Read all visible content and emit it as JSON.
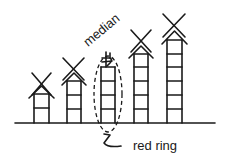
{
  "diagram": {
    "labels": {
      "median": "median",
      "ring": "red ring"
    },
    "towers": [
      {
        "name": "tower-1",
        "stories": 2,
        "has_blades": true
      },
      {
        "name": "tower-2",
        "stories": 3,
        "has_blades": true
      },
      {
        "name": "tower-3",
        "stories": 4,
        "has_blades": false,
        "is_median": true,
        "circled": true
      },
      {
        "name": "tower-4",
        "stories": 5,
        "has_blades": true
      },
      {
        "name": "tower-5",
        "stories": 6,
        "has_blades": true
      }
    ],
    "colors": {
      "ink": "#1a1a1a",
      "background": "#ffffff"
    }
  }
}
